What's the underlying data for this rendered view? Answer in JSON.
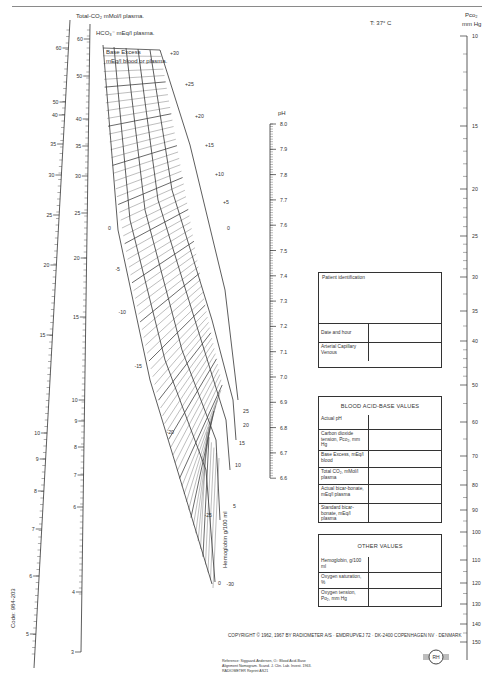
{
  "header": {
    "temperature_label": "T: 37° C"
  },
  "scales": {
    "total_co2": {
      "title": "Total-CO₂ mMol/l plasma.",
      "ticks": [
        "60",
        "50",
        "40",
        "35",
        "30",
        "25",
        "20",
        "15",
        "10",
        "9",
        "8",
        "7",
        "6",
        "5"
      ]
    },
    "hco3": {
      "title": "HCO₃⁻ mEq/l plasma.",
      "ticks": [
        "60",
        "50",
        "40",
        "35",
        "30",
        "25",
        "20",
        "15",
        "10",
        "9",
        "8",
        "7",
        "6",
        "4",
        "3"
      ]
    },
    "base_excess": {
      "title_line1": "Base Excess",
      "title_line2": "mEq/l blood or plasma.",
      "right_ticks": [
        "+30",
        "+25",
        "+20",
        "+15",
        "+10",
        "+5",
        "0"
      ],
      "left_ticks": [
        "0",
        "-5",
        "-10",
        "-15",
        "-20",
        "-25",
        "-30"
      ]
    },
    "hemoglobin": {
      "title": "Hemoglobin g/100 ml",
      "ticks": [
        "25",
        "20",
        "15",
        "10",
        "5",
        "0"
      ]
    },
    "ph": {
      "title": "pH",
      "ticks": [
        "8.0",
        "7.9",
        "7.8",
        "7.7",
        "7.6",
        "7.5",
        "7.4",
        "7.3",
        "7.2",
        "7.1",
        "7.0",
        "6.9",
        "6.8",
        "6.7",
        "6.6"
      ]
    },
    "pco2": {
      "title_line1": "Pco₂",
      "title_line2": "mm Hg",
      "ticks": [
        "10",
        "15",
        "20",
        "25",
        "30",
        "35",
        "40",
        "50",
        "60",
        "70",
        "80",
        "90",
        "100",
        "110",
        "120",
        "130",
        "140",
        "150"
      ]
    }
  },
  "patient_table": {
    "identification_label": "Patient identification",
    "date_label": "Date and hour",
    "sample_label": "Arterial Capillary Venous"
  },
  "acid_base_table": {
    "title": "BLOOD ACID-BASE VALUES",
    "rows": [
      {
        "label": "Actual pH"
      },
      {
        "label": "Carbon dioxide tension, Pco₂, mm Hg"
      },
      {
        "label": "Base Excess, mEq/l blood"
      },
      {
        "label": "Total CO₂, mMol/l plasma"
      },
      {
        "label": "Actual bicar-bonate, mEq/l plasma"
      },
      {
        "label": "Standard bicar-bonate, mEq/l plasma"
      }
    ]
  },
  "other_table": {
    "title": "OTHER VALUES",
    "rows": [
      {
        "label": "Hemoglobin, g/100 ml"
      },
      {
        "label": "Oxygen saturation, %"
      },
      {
        "label": "Oxygen tension, Po₂, mm Hg"
      }
    ]
  },
  "footer": {
    "copyright": "COPYRIGHT © 1962, 1967 BY RADIOMETER A/S · EMDRUPVEJ 72 · DK-2400 COPENHAGEN NV · DENMARK",
    "reference_line1": "Reference: Siggaard-Andersen, O.: Blood Acid-Base",
    "reference_line2": "Alignment Nomogram. Scand. J. Clin. Lab. Invest. 1963.",
    "reference_line3": "RADIOMETER Reprint AS21",
    "code": "Code: 984-203",
    "logo_text": "RH"
  }
}
